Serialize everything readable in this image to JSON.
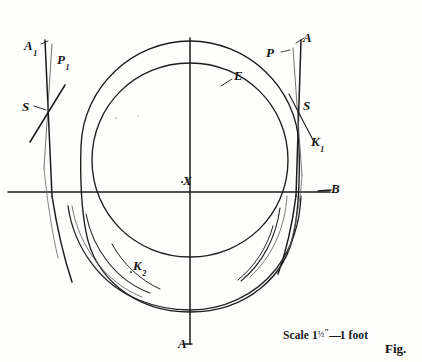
{
  "figure": {
    "ink_color": "#1b1b1b",
    "background_color": "#fdfdfc",
    "labels": {
      "a_upper_left": "A",
      "a_upper_left_sub": "1",
      "p_upper_left": "P",
      "p_upper_left_sub": "1",
      "s_left": "S",
      "p_upper_right": "P",
      "a_upper_right": "A",
      "e_curve": "E",
      "s_right": "S",
      "k1_curve": "K",
      "k1_sub": "1",
      "center": "X",
      "b_axis": "B",
      "k2_curve": "K",
      "k2_sub": "2",
      "a_bottom": "A"
    },
    "scale": {
      "prefix": "Scale 1",
      "fraction": "½",
      "inch_mark": "″",
      "dash": "—",
      "suffix": "1 foot"
    },
    "caption": "Fig."
  }
}
